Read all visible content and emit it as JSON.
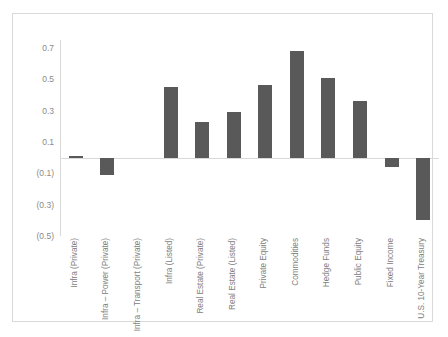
{
  "chart_data": {
    "type": "bar",
    "title": "",
    "xlabel": "",
    "ylabel": "",
    "ylim": [
      -0.5,
      0.75
    ],
    "grid": false,
    "legend": null,
    "ytick_labels": [
      "0.7",
      "0.5",
      "0.3",
      "0.1",
      "(0.1)",
      "(0.3)",
      "(0.5)"
    ],
    "ytick_values": [
      0.7,
      0.5,
      0.3,
      0.1,
      -0.1,
      -0.3,
      -0.5
    ],
    "bar_color": "#595959",
    "axis_color": "#d9d9d9",
    "tick_label_color": "#808080",
    "categories": [
      "Infra (Private)",
      "Infra – Power (Private)",
      "Infra – Transport (Private)",
      "Infra (Listed)",
      "Real Estate (Private)",
      "Real Estate (Listed)",
      "Private Equity",
      "Commodities",
      "Hedge Funds",
      "Public Equity",
      "Fixed Income",
      "U.S. 10-Year Treasury"
    ],
    "values": [
      0.01,
      -0.11,
      0.0,
      0.45,
      0.23,
      0.29,
      0.46,
      0.68,
      0.51,
      0.36,
      -0.06,
      -0.4
    ]
  }
}
